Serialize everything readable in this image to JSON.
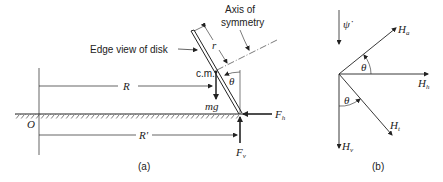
{
  "figure": {
    "panel_a": {
      "caption": "(a)",
      "labels": {
        "axis_of_symmetry_line1": "Axis of",
        "axis_of_symmetry_line2": "symmetry",
        "edge_view": "Edge view of disk",
        "r": "r",
        "cm": "c.m.",
        "theta": "θ",
        "R": "R",
        "R_prime": "R'",
        "mg": "mg",
        "O": "O",
        "F_h_main": "F",
        "F_h_sub": "h",
        "F_v_main": "F",
        "F_v_sub": "v"
      }
    },
    "panel_b": {
      "caption": "(b)",
      "labels": {
        "psi_dot": "ψ̇",
        "H_a_main": "H",
        "H_a_sub": "a",
        "H_h_main": "H",
        "H_h_sub": "h",
        "H_t_main": "H",
        "H_t_sub": "t",
        "H_v_main": "H",
        "H_v_sub": "v",
        "theta_upper": "θ",
        "theta_lower": "θ"
      }
    },
    "colors": {
      "ink": "#222222",
      "background": "#ffffff"
    }
  }
}
